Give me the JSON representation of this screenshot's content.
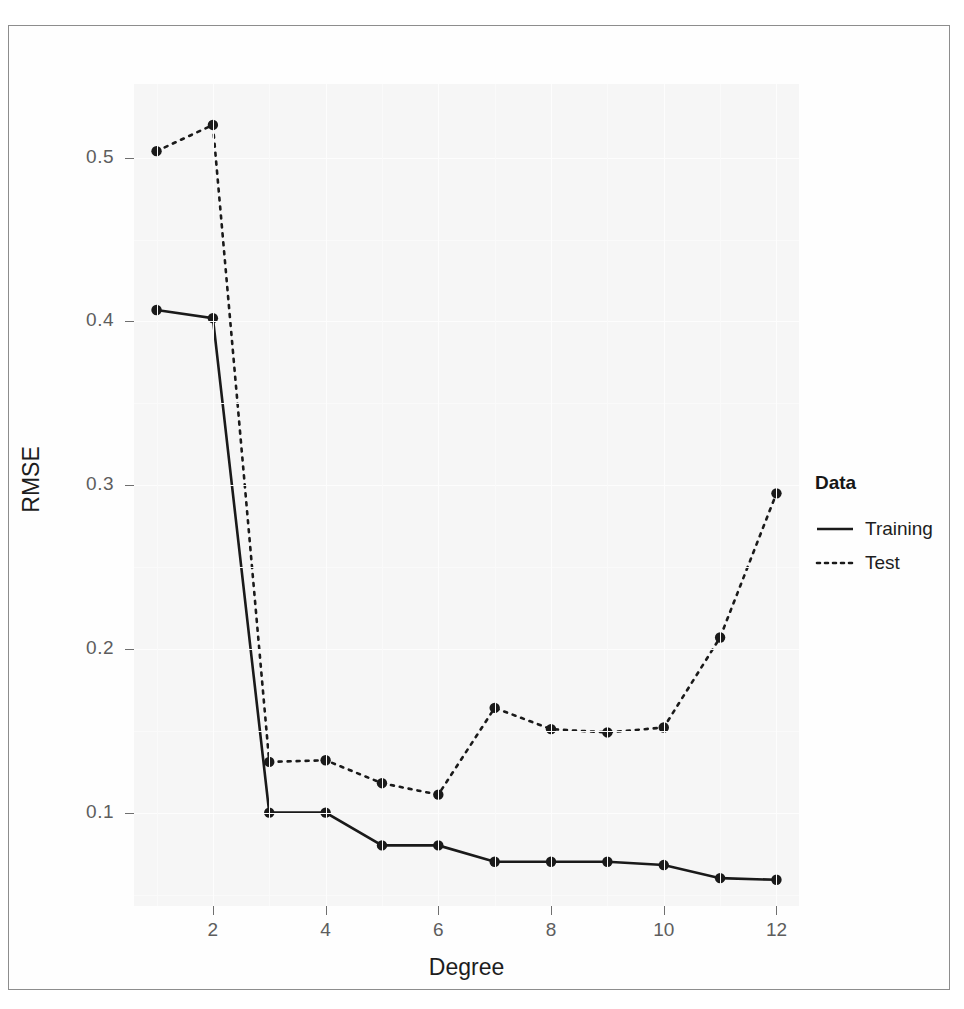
{
  "chart_data": {
    "type": "line",
    "title": "",
    "xlabel": "Degree",
    "ylabel": "RMSE",
    "xlim": [
      0.6,
      12.4
    ],
    "ylim": [
      0.043,
      0.545
    ],
    "xticks": [
      2,
      4,
      6,
      8,
      10,
      12
    ],
    "yticks": [
      0.1,
      0.2,
      0.3,
      0.4,
      0.5
    ],
    "ytick_labels": [
      "0.1",
      "0.2",
      "0.3",
      "0.4",
      "0.5"
    ],
    "xtick_labels": [
      "2",
      "4",
      "6",
      "8",
      "10",
      "12"
    ],
    "grid": true,
    "legend_position": "right",
    "x": [
      1,
      2,
      3,
      4,
      5,
      6,
      7,
      8,
      9,
      10,
      11,
      12
    ],
    "series": [
      {
        "name": "Training",
        "linestyle": "solid",
        "color": "#1a1a1a",
        "values": [
          0.407,
          0.402,
          0.1,
          0.1,
          0.08,
          0.08,
          0.07,
          0.07,
          0.07,
          0.068,
          0.06,
          0.059
        ]
      },
      {
        "name": "Test",
        "linestyle": "dotted",
        "color": "#1a1a1a",
        "values": [
          0.504,
          0.52,
          0.131,
          0.132,
          0.118,
          0.111,
          0.164,
          0.151,
          0.149,
          0.152,
          0.207,
          0.295
        ]
      }
    ]
  },
  "legend": {
    "title": "Data",
    "items": [
      {
        "label": "Training",
        "key": "solid-line-key"
      },
      {
        "label": "Test",
        "key": "dotted-line-key"
      }
    ]
  },
  "axes": {
    "x_title": "Degree",
    "y_title": "RMSE"
  },
  "colors": {
    "line": "#1a1a1a",
    "panel_background": "#f6f6f6",
    "gridline": "#fdfdfd",
    "tick_text": "#5d5d5d",
    "axis_title": "#1d1d1d",
    "page_border": "#8d8d8d"
  }
}
